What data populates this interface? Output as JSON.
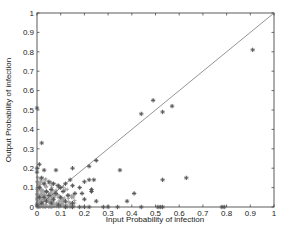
{
  "chart_data": {
    "type": "scatter",
    "title": "",
    "xlabel": "Input Probability of infection",
    "ylabel": "Output Probability of infection",
    "xlim": [
      0,
      1
    ],
    "ylim": [
      0,
      1
    ],
    "xticks": [
      "0",
      "0.1",
      "0.2",
      "0.3",
      "0.4",
      "0.5",
      "0.6",
      "0.7",
      "0.8",
      "0.9",
      "1"
    ],
    "yticks": [
      "0",
      "0.1",
      "0.2",
      "0.3",
      "0.4",
      "0.5",
      "0.6",
      "0.7",
      "0.8",
      "0.9",
      "1"
    ],
    "grid": false,
    "legend": null,
    "marker": "+*",
    "marker_color": "#555555",
    "reference_line": {
      "x": [
        0,
        1
      ],
      "y": [
        0,
        1
      ],
      "color": "#666666",
      "label": "y = x"
    },
    "series": [
      {
        "name": "data",
        "points": [
          [
            0.91,
            0.81
          ],
          [
            0.49,
            0.55
          ],
          [
            0.53,
            0.49
          ],
          [
            0.57,
            0.52
          ],
          [
            0.44,
            0.48
          ],
          [
            0.53,
            0.14
          ],
          [
            0.63,
            0.15
          ],
          [
            0.0,
            0.51
          ],
          [
            0.02,
            0.33
          ],
          [
            0.25,
            0.24
          ],
          [
            0.22,
            0.21
          ],
          [
            0.15,
            0.2
          ],
          [
            0.35,
            0.19
          ],
          [
            0.08,
            0.19
          ],
          [
            0.03,
            0.19
          ],
          [
            0.01,
            0.22
          ],
          [
            0.0,
            0.2
          ],
          [
            0.0,
            0.18
          ],
          [
            0.22,
            0.14
          ],
          [
            0.24,
            0.14
          ],
          [
            0.2,
            0.13
          ],
          [
            0.12,
            0.12
          ],
          [
            0.14,
            0.14
          ],
          [
            0.15,
            0.11
          ],
          [
            0.18,
            0.1
          ],
          [
            0.23,
            0.09
          ],
          [
            0.23,
            0.08
          ],
          [
            0.16,
            0.07
          ],
          [
            0.19,
            0.07
          ],
          [
            0.41,
            0.07
          ],
          [
            0.2,
            0.04
          ],
          [
            0.25,
            0.03
          ],
          [
            0.38,
            0.03
          ],
          [
            0.28,
            0.0
          ],
          [
            0.3,
            0.0
          ],
          [
            0.34,
            0.0
          ],
          [
            0.44,
            0.0
          ],
          [
            0.51,
            0.0
          ],
          [
            0.52,
            0.0
          ],
          [
            0.53,
            0.0
          ],
          [
            0.78,
            0.0
          ],
          [
            0.79,
            0.0
          ],
          [
            0.05,
            0.13
          ],
          [
            0.07,
            0.12
          ],
          [
            0.09,
            0.11
          ],
          [
            0.1,
            0.1
          ],
          [
            0.06,
            0.09
          ],
          [
            0.04,
            0.08
          ],
          [
            0.11,
            0.08
          ],
          [
            0.08,
            0.07
          ],
          [
            0.13,
            0.06
          ],
          [
            0.05,
            0.06
          ],
          [
            0.1,
            0.05
          ],
          [
            0.03,
            0.05
          ],
          [
            0.07,
            0.04
          ],
          [
            0.12,
            0.03
          ],
          [
            0.15,
            0.02
          ],
          [
            0.02,
            0.15
          ],
          [
            0.03,
            0.12
          ],
          [
            0.01,
            0.1
          ],
          [
            0.04,
            0.03
          ],
          [
            0.06,
            0.02
          ],
          [
            0.09,
            0.01
          ],
          [
            0.12,
            0.0
          ],
          [
            0.15,
            0.0
          ],
          [
            0.18,
            0.0
          ],
          [
            0.2,
            0.0
          ],
          [
            0.22,
            0.0
          ],
          [
            0.01,
            0.05
          ],
          [
            0.02,
            0.02
          ],
          [
            0.0,
            0.01
          ]
        ]
      }
    ]
  }
}
